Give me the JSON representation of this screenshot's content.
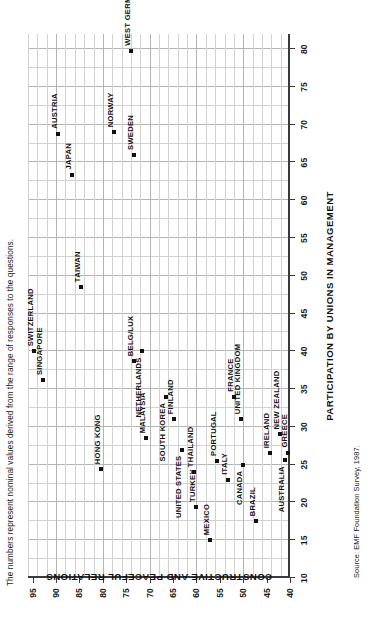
{
  "figure": {
    "caption": "The numbers represent nominal values derived from the range of responses to the questions.",
    "source": "Source: EMF Foundation Survey, 1987."
  },
  "chart_data": {
    "type": "scatter",
    "title": "",
    "xlabel": "PARTICIPATION BY UNIONS IN MANAGEMENT",
    "ylabel": "CONSTRUCTIVE AND PEACEFUL RELATIONS",
    "xlim": [
      10,
      82
    ],
    "ylim": [
      40,
      96
    ],
    "xticks": [
      10,
      15,
      20,
      25,
      30,
      35,
      40,
      45,
      50,
      55,
      60,
      65,
      70,
      75,
      80
    ],
    "yticks": [
      40,
      45,
      50,
      55,
      60,
      65,
      70,
      75,
      80,
      85,
      90,
      95
    ],
    "grid": true,
    "legend": "none",
    "points": [
      {
        "label": "SWITZERLAND",
        "x": 40.0,
        "y": 94.8,
        "lx": 5,
        "ly": -2
      },
      {
        "label": "SINGAPORE",
        "x": 36.2,
        "y": 92.7,
        "lx": 5,
        "ly": -2
      },
      {
        "label": "AUSTRIA",
        "x": 68.8,
        "y": 89.5,
        "lx": 5,
        "ly": -2
      },
      {
        "label": "JAPAN",
        "x": 63.4,
        "y": 86.6,
        "lx": 5,
        "ly": -2
      },
      {
        "label": "TAIWAN",
        "x": 48.5,
        "y": 84.6,
        "lx": 5,
        "ly": -2
      },
      {
        "label": "HONG KONG",
        "x": 24.4,
        "y": 80.4,
        "lx": 5,
        "ly": -2
      },
      {
        "label": "NORWAY",
        "x": 69.0,
        "y": 77.7,
        "lx": 5,
        "ly": -2
      },
      {
        "label": "WEST GERMANY",
        "x": 79.8,
        "y": 74.0,
        "lx": 5,
        "ly": -2
      },
      {
        "label": "SWEDEN",
        "x": 66.0,
        "y": 73.4,
        "lx": 5,
        "ly": -2
      },
      {
        "label": "BELG/LUX",
        "x": 38.7,
        "y": 73.4,
        "lx": 5,
        "ly": -2
      },
      {
        "label": "NETHERLANDS",
        "x": 40.0,
        "y": 71.6,
        "lx": -6,
        "ly": -2,
        "anchor": "end"
      },
      {
        "label": "MALAYSIA",
        "x": 28.5,
        "y": 70.8,
        "lx": 5,
        "ly": -2
      },
      {
        "label": "SOUTH KOREA",
        "x": 34.0,
        "y": 66.6,
        "lx": -6,
        "ly": -2,
        "anchor": "end"
      },
      {
        "label": "FINLAND",
        "x": 31.0,
        "y": 64.8,
        "lx": 5,
        "ly": -2
      },
      {
        "label": "UNITED STATES",
        "x": 27.0,
        "y": 63.0,
        "lx": -6,
        "ly": -2,
        "anchor": "end"
      },
      {
        "label": "THAILAND",
        "x": 24.0,
        "y": 60.6,
        "lx": 5,
        "ly": -2
      },
      {
        "label": "TURKEY",
        "x": 19.4,
        "y": 60.0,
        "lx": 5,
        "ly": -2
      },
      {
        "label": "MEXICO",
        "x": 15.0,
        "y": 57.0,
        "lx": 5,
        "ly": -2
      },
      {
        "label": "PORTUGAL",
        "x": 25.5,
        "y": 55.5,
        "lx": 5,
        "ly": -2
      },
      {
        "label": "ITALY",
        "x": 23.0,
        "y": 53.2,
        "lx": 5,
        "ly": -2
      },
      {
        "label": "FRANCE",
        "x": 34.0,
        "y": 52.0,
        "lx": 5,
        "ly": -2
      },
      {
        "label": "UNITED KINGDOM",
        "x": 31.0,
        "y": 50.5,
        "lx": 5,
        "ly": -2
      },
      {
        "label": "CANADA",
        "x": 25.0,
        "y": 50.0,
        "lx": -6,
        "ly": -2,
        "anchor": "end"
      },
      {
        "label": "BRAZIL",
        "x": 17.5,
        "y": 47.2,
        "lx": 5,
        "ly": -2
      },
      {
        "label": "IRELAND",
        "x": 26.5,
        "y": 44.2,
        "lx": 5,
        "ly": -2
      },
      {
        "label": "NEW ZEALAND",
        "x": 29.0,
        "y": 42.2,
        "lx": 5,
        "ly": -2
      },
      {
        "label": "AUSTRALIA",
        "x": 25.6,
        "y": 41.0,
        "lx": -6,
        "ly": -2,
        "anchor": "end"
      },
      {
        "label": "GREECE",
        "x": 26.6,
        "y": 40.4,
        "lx": 5,
        "ly": -2
      }
    ]
  }
}
